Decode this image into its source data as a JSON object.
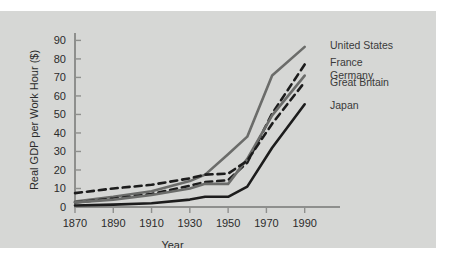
{
  "figure": {
    "background_color": "#d6d7d5",
    "page_color": "#ffffff"
  },
  "chart_data": {
    "type": "line",
    "title": "",
    "xlabel": "Year",
    "ylabel": "Real GDP per Work Hour ($)",
    "x": [
      1870,
      1890,
      1910,
      1930,
      1938,
      1950,
      1960,
      1973,
      1990
    ],
    "xlim": [
      1870,
      1998
    ],
    "ylim": [
      0,
      94
    ],
    "xticks": [
      1870,
      1890,
      1910,
      1930,
      1950,
      1970,
      1990
    ],
    "xticklabels": [
      "1870",
      "1890",
      "1910",
      "1930",
      "1950",
      "1970",
      "1990"
    ],
    "yticks": [
      0,
      10,
      20,
      30,
      40,
      50,
      60,
      70,
      80,
      90
    ],
    "yticklabels": [
      "0",
      "10",
      "20",
      "30",
      "40",
      "50",
      "60",
      "70",
      "80",
      "90"
    ],
    "grid": false,
    "legend_position": "right-inline-labels",
    "series": [
      {
        "name": "United States",
        "color": "#6b6c6a",
        "style": "solid",
        "label_y_value": 87,
        "values": [
          3.0,
          5.5,
          8.5,
          14.0,
          17.5,
          28.5,
          38.0,
          71.0,
          86.5
        ]
      },
      {
        "name": "France",
        "color": "#1c1c1c",
        "style": "dashed",
        "label_y_value": 78,
        "values": [
          2.5,
          4.5,
          7.0,
          11.5,
          13.5,
          14.5,
          24.0,
          50.5,
          77.0
        ]
      },
      {
        "name": "Germany",
        "color": "#6b6c6a",
        "style": "solid",
        "label_y_value": 71,
        "values": [
          2.5,
          4.0,
          6.5,
          10.0,
          12.5,
          12.5,
          26.0,
          49.5,
          71.0
        ]
      },
      {
        "name": "Great Britain",
        "color": "#1c1c1c",
        "style": "dashed",
        "label_y_value": 67,
        "values": [
          7.5,
          10.0,
          12.0,
          15.5,
          17.5,
          18.0,
          25.0,
          45.0,
          67.5
        ]
      },
      {
        "name": "Japan",
        "color": "#1c1c1c",
        "style": "solid",
        "label_y_value": 55,
        "values": [
          0.8,
          1.3,
          2.0,
          4.0,
          5.5,
          5.5,
          11.0,
          32.0,
          55.5
        ]
      }
    ]
  }
}
